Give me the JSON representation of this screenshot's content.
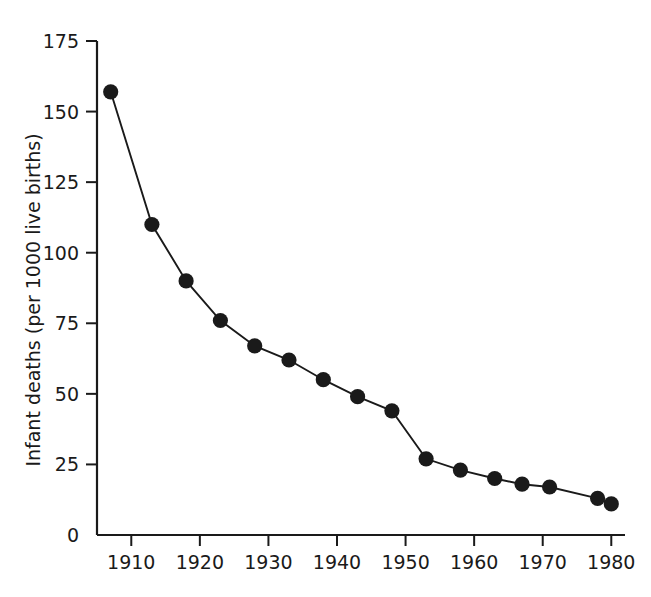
{
  "figure": {
    "background_color": "#ffffff",
    "ink_color": "#1a1a1a"
  },
  "chart_data": {
    "type": "line",
    "title": "",
    "subtitle": "",
    "xlabel": "",
    "ylabel": "Infant deaths (per 1000 live births)",
    "xlim": [
      1905,
      1982
    ],
    "ylim": [
      0,
      175
    ],
    "grid": false,
    "legend": null,
    "marker": "filled-circle",
    "line_style": "solid",
    "x_ticks": [
      1910,
      1920,
      1930,
      1940,
      1950,
      1960,
      1970,
      1980
    ],
    "x_tick_labels": [
      "1910",
      "1920",
      "1930",
      "1940",
      "1950",
      "1960",
      "1970",
      "1980"
    ],
    "y_ticks": [
      0,
      25,
      50,
      75,
      100,
      125,
      150,
      175
    ],
    "y_tick_labels": [
      "0",
      "25",
      "50",
      "75",
      "100",
      "125",
      "150",
      "175"
    ],
    "x": [
      1907,
      1913,
      1918,
      1923,
      1928,
      1933,
      1938,
      1943,
      1948,
      1953,
      1958,
      1963,
      1967,
      1971,
      1978,
      1980
    ],
    "values": [
      157,
      110,
      90,
      76,
      67,
      62,
      55,
      49,
      44,
      27,
      23,
      20,
      18,
      17,
      13,
      11
    ],
    "series": [
      {
        "name": "Infant deaths per 1000 live births",
        "x": [
          1907,
          1913,
          1918,
          1923,
          1928,
          1933,
          1938,
          1943,
          1948,
          1953,
          1958,
          1963,
          1967,
          1971,
          1978,
          1980
        ],
        "values": [
          157,
          110,
          90,
          76,
          67,
          62,
          55,
          49,
          44,
          27,
          23,
          20,
          18,
          17,
          13,
          11
        ]
      }
    ]
  }
}
